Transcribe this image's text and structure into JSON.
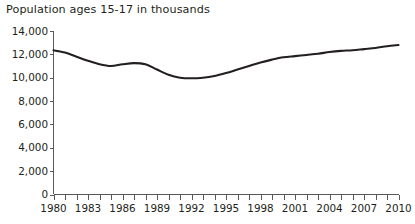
{
  "chart_data": {
    "type": "line",
    "title": "Population ages 15-17 in thousands",
    "xlabel": "",
    "ylabel": "",
    "grid": false,
    "legend": false,
    "xlim": [
      1980,
      2010
    ],
    "ylim": [
      0,
      14000
    ],
    "ytick_values": [
      0,
      2000,
      4000,
      6000,
      8000,
      10000,
      12000,
      14000
    ],
    "ytick_labels": [
      "0",
      "2,000",
      "4,000",
      "6,000",
      "8,000",
      "10,000",
      "12,000",
      "14,000"
    ],
    "xtick_values": [
      1980,
      1981,
      1982,
      1983,
      1984,
      1985,
      1986,
      1987,
      1988,
      1989,
      1990,
      1991,
      1992,
      1993,
      1994,
      1995,
      1996,
      1997,
      1998,
      1999,
      2000,
      2001,
      2002,
      2003,
      2004,
      2005,
      2006,
      2007,
      2008,
      2009,
      2010
    ],
    "xtick_labels_shown": [
      "1980",
      "1983",
      "1986",
      "1989",
      "1992",
      "1995",
      "1998",
      "2001",
      "2004",
      "2007",
      "2010"
    ],
    "xtick_label_years": [
      1980,
      1983,
      1986,
      1989,
      1992,
      1995,
      1998,
      2001,
      2004,
      2007,
      2010
    ],
    "line_color": "#231f20",
    "axis_color": "#58595b",
    "background_color": "#ffffff",
    "x": [
      1980,
      1981,
      1982,
      1983,
      1984,
      1985,
      1986,
      1987,
      1988,
      1989,
      1990,
      1991,
      1992,
      1993,
      1994,
      1995,
      1996,
      1997,
      1998,
      1999,
      2000,
      2001,
      2002,
      2003,
      2004,
      2005,
      2006,
      2007,
      2008,
      2009,
      2010
    ],
    "values": [
      12350,
      12150,
      11800,
      11450,
      11150,
      11000,
      11150,
      11250,
      11150,
      10700,
      10250,
      10000,
      9950,
      10000,
      10150,
      10400,
      10700,
      11000,
      11300,
      11550,
      11750,
      11850,
      11950,
      12050,
      12200,
      12300,
      12350,
      12450,
      12550,
      12700,
      12800
    ],
    "series": [
      {
        "name": "Population ages 15-17 in thousands",
        "values": [
          12350,
          12150,
          11800,
          11450,
          11150,
          11000,
          11150,
          11250,
          11150,
          10700,
          10250,
          10000,
          9950,
          10000,
          10150,
          10400,
          10700,
          11000,
          11300,
          11550,
          11750,
          11850,
          11950,
          12050,
          12200,
          12300,
          12350,
          12450,
          12550,
          12700,
          12800
        ]
      }
    ]
  }
}
